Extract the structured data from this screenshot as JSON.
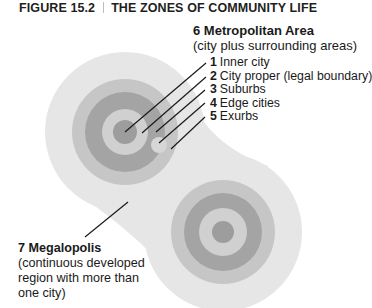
{
  "figure": {
    "number": "FIGURE 15.2",
    "title": "THE ZONES OF COMMUNITY LIFE"
  },
  "metropolitan": {
    "heading": "6 Metropolitan Area",
    "description": "(city plus surrounding areas)"
  },
  "zones": [
    {
      "num": "1",
      "label": "Inner city"
    },
    {
      "num": "2",
      "label": "City proper (legal boundary)"
    },
    {
      "num": "3",
      "label": "Suburbs"
    },
    {
      "num": "4",
      "label": "Edge cities"
    },
    {
      "num": "5",
      "label": "Exurbs"
    }
  ],
  "megalopolis": {
    "heading": "7 Megalopolis",
    "lines": [
      "(continuous developed",
      "region with more than",
      "one city)"
    ]
  },
  "colors": {
    "outer": "#e6e6e6",
    "ring_mid": "#c6c6c6",
    "ring_dark": "#a4a4a4",
    "inner_light": "#d0d0d0",
    "center": "#9d9d9d",
    "leader": "#1a1a1a"
  }
}
